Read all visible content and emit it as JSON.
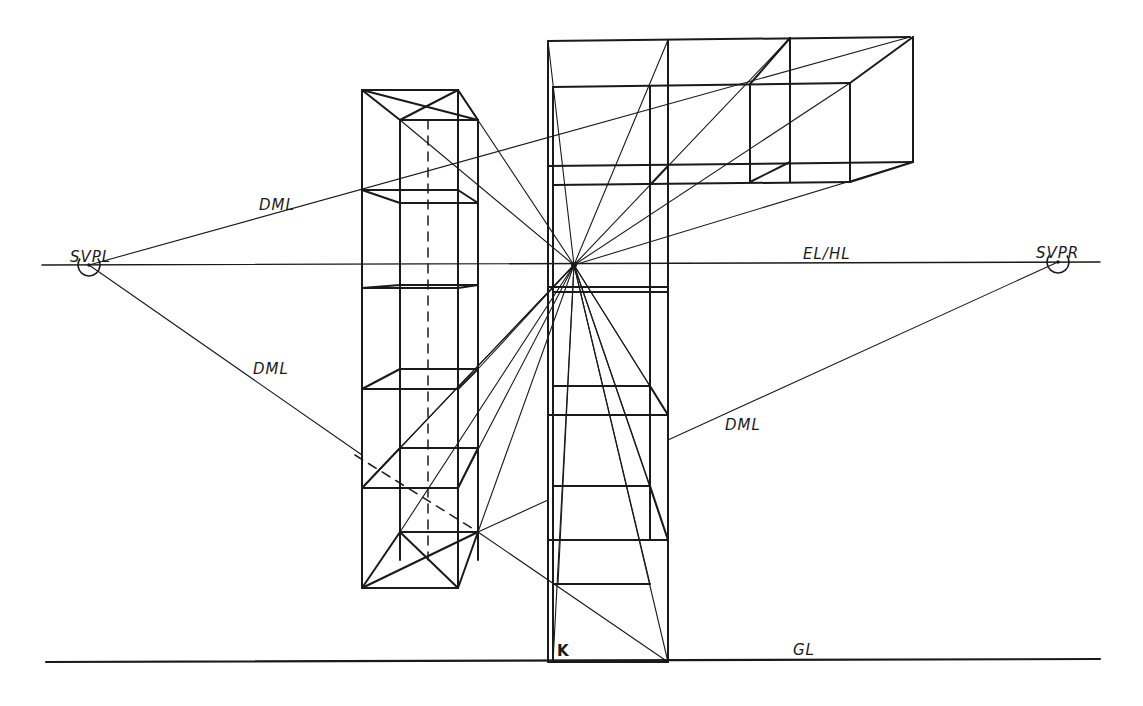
{
  "diagram": {
    "ink_color": "#1a1a1a",
    "background": "#ffffff",
    "labels": [
      {
        "id": "svpl",
        "text": "SVPL",
        "x": 70,
        "y": 250
      },
      {
        "id": "svpr",
        "text": "SVPR",
        "x": 1036,
        "y": 246
      },
      {
        "id": "el-hl",
        "text": "EL/HL",
        "x": 803,
        "y": 247
      },
      {
        "id": "dml-upper-left",
        "text": "DML",
        "x": 259,
        "y": 198
      },
      {
        "id": "dml-lower-left",
        "text": "DML",
        "x": 253,
        "y": 362
      },
      {
        "id": "dml-right",
        "text": "DML",
        "x": 725,
        "y": 418
      },
      {
        "id": "gl",
        "text": "GL",
        "x": 793,
        "y": 643
      },
      {
        "id": "k",
        "text": "K",
        "x": 557,
        "y": 644
      }
    ],
    "vanishing_points": [
      {
        "name": "SVPL",
        "x": 89,
        "y": 265,
        "r": 11
      },
      {
        "name": "SVPR",
        "x": 1058,
        "y": 262,
        "r": 11
      }
    ],
    "center_point": {
      "x": 574,
      "y": 265
    },
    "horizon_line": {
      "x1": 42,
      "y1": 265,
      "x2": 1100,
      "y2": 262
    },
    "ground_line": {
      "x1": 46,
      "y1": 662,
      "x2": 1100,
      "y2": 659
    },
    "heavy_lines": [
      [
        362,
        90,
        458,
        90
      ],
      [
        458,
        90,
        478,
        120
      ],
      [
        362,
        90,
        400,
        120
      ],
      [
        400,
        120,
        478,
        120
      ],
      [
        362,
        90,
        362,
        588
      ],
      [
        458,
        90,
        458,
        588
      ],
      [
        400,
        120,
        400,
        560
      ],
      [
        478,
        120,
        478,
        560
      ],
      [
        362,
        90,
        478,
        120
      ],
      [
        458,
        90,
        400,
        120
      ],
      [
        362,
        190,
        458,
        190
      ],
      [
        362,
        190,
        400,
        203
      ],
      [
        400,
        203,
        478,
        203
      ],
      [
        458,
        190,
        478,
        203
      ],
      [
        362,
        288,
        458,
        288
      ],
      [
        362,
        288,
        400,
        285
      ],
      [
        400,
        285,
        478,
        285
      ],
      [
        458,
        288,
        478,
        285
      ],
      [
        362,
        389,
        458,
        389
      ],
      [
        362,
        389,
        400,
        369
      ],
      [
        400,
        369,
        478,
        369
      ],
      [
        458,
        389,
        478,
        369
      ],
      [
        362,
        488,
        458,
        488
      ],
      [
        362,
        488,
        400,
        448
      ],
      [
        400,
        448,
        478,
        448
      ],
      [
        458,
        488,
        478,
        448
      ],
      [
        362,
        588,
        458,
        588
      ],
      [
        362,
        588,
        400,
        532
      ],
      [
        400,
        532,
        478,
        532
      ],
      [
        458,
        588,
        478,
        532
      ],
      [
        362,
        588,
        478,
        532
      ],
      [
        400,
        532,
        458,
        588
      ],
      [
        548,
        41,
        910,
        37
      ],
      [
        548,
        41,
        548,
        662
      ],
      [
        668,
        40,
        668,
        662
      ],
      [
        553,
        87,
        850,
        83
      ],
      [
        553,
        87,
        553,
        662
      ],
      [
        650,
        87,
        650,
        540
      ],
      [
        548,
        166,
        913,
        162
      ],
      [
        553,
        185,
        850,
        182
      ],
      [
        913,
        37,
        913,
        162
      ],
      [
        850,
        83,
        850,
        182
      ],
      [
        790,
        38,
        790,
        182
      ],
      [
        750,
        84,
        750,
        182
      ],
      [
        650,
        185,
        668,
        166
      ],
      [
        750,
        182,
        790,
        162
      ],
      [
        850,
        182,
        913,
        162
      ],
      [
        750,
        84,
        790,
        38
      ],
      [
        850,
        83,
        913,
        37
      ],
      [
        548,
        287,
        668,
        287
      ],
      [
        553,
        292,
        668,
        292
      ],
      [
        548,
        415,
        668,
        415
      ],
      [
        553,
        386,
        650,
        386
      ],
      [
        650,
        386,
        668,
        415
      ],
      [
        548,
        540,
        668,
        540
      ],
      [
        553,
        486,
        650,
        486
      ],
      [
        650,
        486,
        668,
        540
      ],
      [
        553,
        584,
        650,
        584
      ],
      [
        548,
        662,
        668,
        662
      ]
    ],
    "dashed_lines": [
      [
        428,
        120,
        428,
        560
      ],
      [
        355,
        455,
        478,
        532
      ]
    ],
    "thin_lines": [
      [
        89,
        265,
        910,
        37
      ],
      [
        89,
        265,
        362,
        455
      ],
      [
        478,
        532,
        668,
        662
      ],
      [
        668,
        440,
        1058,
        262
      ],
      [
        478,
        532,
        548,
        500
      ],
      [
        400,
        120,
        574,
        265
      ],
      [
        458,
        90,
        574,
        265
      ],
      [
        548,
        41,
        574,
        265
      ],
      [
        668,
        40,
        574,
        265
      ],
      [
        790,
        38,
        574,
        265
      ],
      [
        850,
        83,
        574,
        265
      ],
      [
        913,
        162,
        574,
        265
      ],
      [
        362,
        488,
        574,
        265
      ],
      [
        400,
        448,
        574,
        265
      ],
      [
        478,
        369,
        574,
        265
      ],
      [
        458,
        488,
        574,
        265
      ],
      [
        400,
        532,
        574,
        265
      ],
      [
        478,
        532,
        574,
        265
      ],
      [
        553,
        662,
        574,
        265
      ],
      [
        558,
        584,
        574,
        265
      ],
      [
        668,
        662,
        574,
        265
      ],
      [
        650,
        584,
        574,
        265
      ],
      [
        668,
        540,
        574,
        265
      ],
      [
        650,
        486,
        574,
        265
      ],
      [
        668,
        415,
        574,
        265
      ],
      [
        650,
        386,
        574,
        265
      ]
    ]
  }
}
